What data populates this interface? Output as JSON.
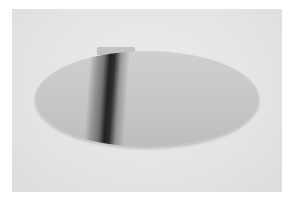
{
  "image": {
    "subject": "oval strip with dark vertical band",
    "colors": {
      "border": "#ffffff",
      "background": "#e6e6e6",
      "oval": "#c8c8c8",
      "band": "#1e1e1e"
    }
  }
}
